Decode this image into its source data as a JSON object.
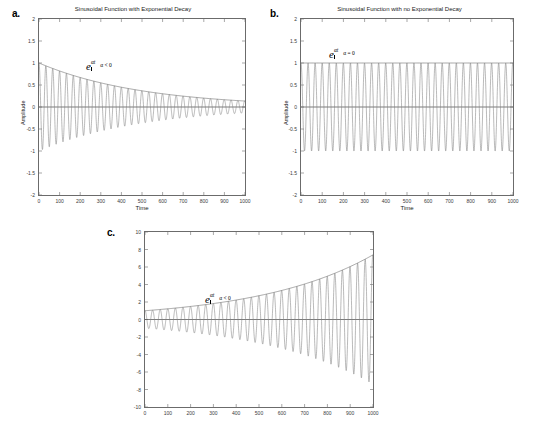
{
  "figure": {
    "background_color": "#ffffff",
    "line_color": "#808080",
    "axis_color": "#6b6b6b"
  },
  "panels": [
    {
      "label": "a.",
      "title": "Sinusoidal Function with Exponential Decay",
      "xlabel": "Time",
      "ylabel": "Amplitude",
      "annotation_base": "e",
      "annotation_exponent": "αt",
      "annotation_condition": "α < 0",
      "yticks": [
        "2",
        "1.5",
        "1",
        "0.5",
        "0",
        "-0.5",
        "-1",
        "-1.5",
        "-2"
      ],
      "xticks": [
        "0",
        "100",
        "200",
        "300",
        "400",
        "500",
        "600",
        "700",
        "800",
        "900",
        "1000"
      ]
    },
    {
      "label": "b.",
      "title": "Sinusoidal Function with no Exponential Decay",
      "xlabel": "Time",
      "ylabel": "Amplitude",
      "annotation_base": "e",
      "annotation_exponent": "αt",
      "annotation_condition": "α = 0",
      "yticks": [
        "2",
        "1.5",
        "1",
        "0.5",
        "0",
        "-0.5",
        "-1",
        "-1.5",
        "-2"
      ],
      "xticks": [
        "0",
        "100",
        "200",
        "300",
        "400",
        "500",
        "600",
        "700",
        "800",
        "900",
        "1000"
      ]
    },
    {
      "label": "c.",
      "title": "",
      "xlabel": "",
      "ylabel": "",
      "annotation_base": "e",
      "annotation_exponent": "αt",
      "annotation_condition": "α < 0",
      "yticks": [
        "10",
        "8",
        "6",
        "4",
        "2",
        "0",
        "-2",
        "-4",
        "-6",
        "-8",
        "-10"
      ],
      "xticks": [
        "0",
        "100",
        "200",
        "300",
        "400",
        "500",
        "600",
        "700",
        "800",
        "900",
        "1000"
      ]
    }
  ],
  "chart_data": [
    {
      "type": "line",
      "title": "Sinusoidal Function with Exponential Decay",
      "xlabel": "Time",
      "ylabel": "Amplitude",
      "xlim": [
        0,
        1000
      ],
      "ylim": [
        -2,
        2
      ],
      "xticks": [
        0,
        100,
        200,
        300,
        400,
        500,
        600,
        700,
        800,
        900,
        1000
      ],
      "yticks": [
        -2,
        -1.5,
        -1,
        -0.5,
        0,
        0.5,
        1,
        1.5,
        2
      ],
      "grid": false,
      "legend": "none",
      "annotations": [
        {
          "text": "e^(αt), α < 0",
          "x": 300,
          "y": 1.28
        }
      ],
      "series": [
        {
          "name": "damped sinusoid",
          "equation": "y = exp(-0.002*t) * cos(2*pi*t/33.3)",
          "amplitude_decay_rate": -0.002,
          "period": 33.3,
          "color": "#808080"
        },
        {
          "name": "envelope e^(alpha t)",
          "equation": "y = exp(-0.002*t)",
          "samples_x": [
            0,
            100,
            200,
            300,
            400,
            500,
            600,
            700,
            800,
            900,
            1000
          ],
          "samples_y": [
            1.0,
            0.82,
            0.67,
            0.55,
            0.45,
            0.37,
            0.3,
            0.25,
            0.2,
            0.17,
            0.14
          ],
          "color": "#808080"
        },
        {
          "name": "zero baseline",
          "equation": "y = 0",
          "color": "#444444"
        }
      ]
    },
    {
      "type": "line",
      "title": "Sinusoidal Function with no Exponential Decay",
      "xlabel": "Time",
      "ylabel": "Amplitude",
      "xlim": [
        0,
        1000
      ],
      "ylim": [
        -2,
        2
      ],
      "xticks": [
        0,
        100,
        200,
        300,
        400,
        500,
        600,
        700,
        800,
        900,
        1000
      ],
      "yticks": [
        -2,
        -1.5,
        -1,
        -0.5,
        0,
        0.5,
        1,
        1.5,
        2
      ],
      "grid": false,
      "legend": "none",
      "annotations": [
        {
          "text": "e^(αt), α = 0",
          "x": 300,
          "y": 1.28
        }
      ],
      "series": [
        {
          "name": "undamped sinusoid",
          "equation": "y = cos(2*pi*t/33.3)",
          "amplitude_decay_rate": 0,
          "period": 33.3,
          "color": "#808080"
        },
        {
          "name": "envelope e^(alpha t)",
          "equation": "y = 1",
          "samples_x": [
            0,
            100,
            200,
            300,
            400,
            500,
            600,
            700,
            800,
            900,
            1000
          ],
          "samples_y": [
            1,
            1,
            1,
            1,
            1,
            1,
            1,
            1,
            1,
            1,
            1
          ],
          "color": "#808080"
        },
        {
          "name": "zero baseline",
          "equation": "y = 0",
          "color": "#444444"
        }
      ]
    },
    {
      "type": "line",
      "title": "",
      "xlabel": "",
      "ylabel": "",
      "xlim": [
        0,
        1000
      ],
      "ylim": [
        -10,
        10
      ],
      "xticks": [
        0,
        100,
        200,
        300,
        400,
        500,
        600,
        700,
        800,
        900,
        1000
      ],
      "yticks": [
        -10,
        -8,
        -6,
        -4,
        -2,
        0,
        2,
        4,
        6,
        8,
        10
      ],
      "grid": false,
      "legend": "none",
      "annotations": [
        {
          "text": "e^(αt), α < 0",
          "x": 300,
          "y": 3.1
        }
      ],
      "series": [
        {
          "name": "growing sinusoid",
          "equation": "y = exp(0.002*t) * cos(2*pi*t/33.3)",
          "amplitude_growth_rate": 0.002,
          "period": 33.3,
          "color": "#808080"
        },
        {
          "name": "envelope e^(alpha t)",
          "equation": "y = exp(0.002*t)",
          "samples_x": [
            0,
            100,
            200,
            300,
            400,
            500,
            600,
            700,
            800,
            900,
            1000
          ],
          "samples_y": [
            1.0,
            1.22,
            1.49,
            1.82,
            2.23,
            2.72,
            3.32,
            4.06,
            4.95,
            6.05,
            7.39
          ],
          "color": "#808080"
        },
        {
          "name": "zero baseline",
          "equation": "y = 0",
          "color": "#444444"
        }
      ]
    }
  ]
}
